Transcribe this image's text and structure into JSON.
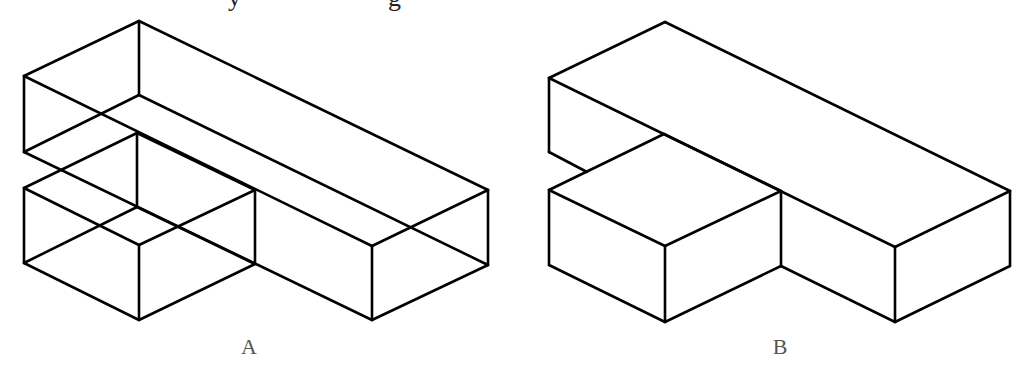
{
  "caption": {
    "visible_glyphs": [
      {
        "char": "y",
        "x": 228
      },
      {
        "char": "g",
        "x": 388
      }
    ],
    "note": "top text line clipped; only descenders visible"
  },
  "figures": [
    {
      "id": "A",
      "label": "A",
      "style": "wireframe (hidden edges shown)",
      "stroke": "#000000"
    },
    {
      "id": "B",
      "label": "B",
      "style": "solid (hidden edges removed)",
      "stroke": "#000000"
    }
  ],
  "colors": {
    "background": "#ffffff",
    "line": "#000000",
    "label": "#555555"
  }
}
